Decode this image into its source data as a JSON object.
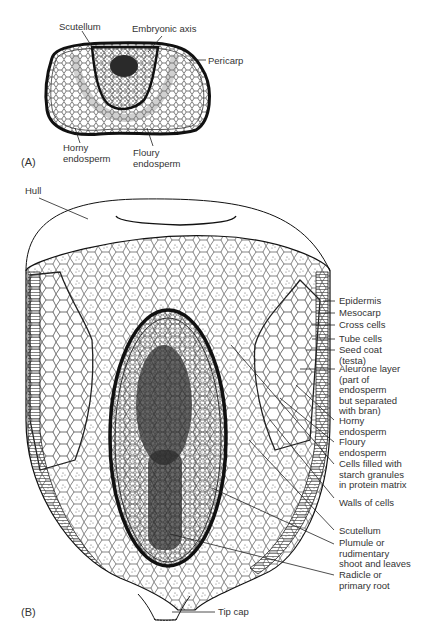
{
  "figure": {
    "panel_a": {
      "tag": "(A)",
      "title": "Cross-section of grain",
      "labels": {
        "scutellum": "Scutellum",
        "embryonic_axis": "Embryonic axis",
        "pericarp": "Pericarp",
        "horny_endosperm": [
          "Horny",
          "endosperm"
        ],
        "floury_endosperm": [
          "Floury",
          "endosperm"
        ]
      }
    },
    "panel_b": {
      "tag": "(B)",
      "title": "Longitudinal section of grain",
      "labels": {
        "hull": "Hull",
        "epidermis": "Epidermis",
        "mesocarp": "Mesocarp",
        "cross_cells": "Cross cells",
        "tube_cells": "Tube cells",
        "seed_coat": [
          "Seed coat",
          "(testa)"
        ],
        "aleurone": [
          "Aleurone layer",
          "(part of",
          "endosperm",
          "but separated",
          "with bran)"
        ],
        "horny_endosperm": [
          "Horny",
          "endosperm"
        ],
        "floury_endosperm": [
          "Floury",
          "endosperm"
        ],
        "cells_filled": [
          "Cells filled with",
          "starch granules",
          "in protein matrix"
        ],
        "walls_of_cells": "Walls of cells",
        "scutellum": "Scutellum",
        "plumule": [
          "Plumule or",
          "rudimentary",
          "shoot and leaves"
        ],
        "radicle": [
          "Radicle or",
          "primary root"
        ],
        "tip_cap": "Tip cap"
      }
    },
    "colors": {
      "ink": "#1a1a1a",
      "label": "#333333",
      "paper": "#ffffff",
      "embryo_dark": "#2a2a2a"
    }
  }
}
